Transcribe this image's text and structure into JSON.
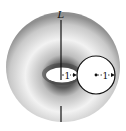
{
  "figure": {
    "type": "torus-diagram",
    "axis_label": "L",
    "inner_radius_label": "1",
    "tube_radius_label": "1",
    "colors": {
      "stroke": "#111111",
      "shade_dark": "#8a8a8a",
      "shade_light": "#f4f4f4",
      "background": "#ffffff"
    }
  }
}
